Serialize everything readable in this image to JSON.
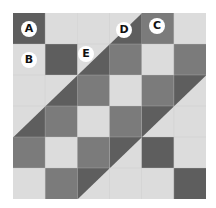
{
  "diagram": {
    "type": "quilt-grid",
    "rows": 6,
    "cols": 6,
    "colors": {
      "dark": "#5e5e5e",
      "medium": "#7b7b7b",
      "light": "#dcdcdc",
      "gridline": "#c8c8c8"
    },
    "cells": [
      [
        "dark",
        "light",
        "light",
        "split-light-dark",
        "medium",
        "light"
      ],
      [
        "light",
        "dark",
        "split-light-dark",
        "medium",
        "light",
        "medium"
      ],
      [
        "light",
        "split-light-dark",
        "medium",
        "light",
        "medium",
        "split-dark-light"
      ],
      [
        "split-light-dark",
        "medium",
        "light",
        "medium",
        "split-dark-light",
        "light"
      ],
      [
        "medium",
        "light",
        "medium",
        "split-dark-light",
        "dark",
        "light"
      ],
      [
        "light",
        "medium",
        "split-dark-light",
        "light",
        "light",
        "dark"
      ]
    ],
    "labels": [
      {
        "text": "A",
        "x": 29,
        "y": 29
      },
      {
        "text": "B",
        "x": 29,
        "y": 60
      },
      {
        "text": "E",
        "x": 86,
        "y": 54
      },
      {
        "text": "D",
        "x": 124,
        "y": 30
      },
      {
        "text": "C",
        "x": 157,
        "y": 26
      }
    ]
  }
}
